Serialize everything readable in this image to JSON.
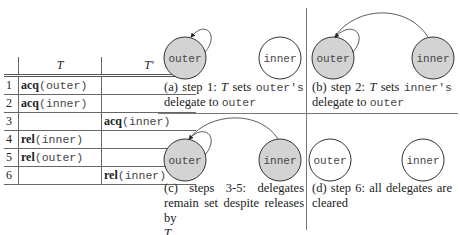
{
  "table": {
    "headers": [
      "",
      "T",
      "T′"
    ],
    "rows": [
      {
        "n": "1",
        "t_op": "acq",
        "t_arg": "(outer)",
        "tp_op": "",
        "tp_arg": ""
      },
      {
        "n": "2",
        "t_op": "acq",
        "t_arg": "(inner)",
        "tp_op": "",
        "tp_arg": ""
      },
      {
        "n": "3",
        "t_op": "",
        "t_arg": "",
        "tp_op": "acq",
        "tp_arg": "(inner)"
      },
      {
        "n": "4",
        "t_op": "rel",
        "t_arg": "(inner)",
        "tp_op": "",
        "tp_arg": ""
      },
      {
        "n": "5",
        "t_op": "rel",
        "t_arg": "(outer)",
        "tp_op": "",
        "tp_arg": ""
      },
      {
        "n": "6",
        "t_op": "",
        "t_arg": "",
        "tp_op": "rel",
        "tp_arg": "(inner)"
      }
    ]
  },
  "panels": {
    "a": {
      "outer_label": "outer",
      "inner_label": "inner",
      "outer_filled": true,
      "inner_filled": false,
      "caption": {
        "p1": "(a) step 1: ",
        "T": "T",
        "p2": " sets ",
        "m1": "outer's",
        "p3": " delegate to ",
        "m2": "outer"
      }
    },
    "b": {
      "outer_label": "outer",
      "inner_label": "inner",
      "outer_filled": true,
      "inner_filled": true,
      "caption": {
        "p1": "(b) step 2: ",
        "T": "T",
        "p2": " sets ",
        "m1": "inner's",
        "p3": " delegate to ",
        "m2": "outer"
      }
    },
    "c": {
      "outer_label": "outer",
      "inner_label": "inner",
      "outer_filled": true,
      "inner_filled": true,
      "caption": {
        "p1": "(c) steps 3-5: delegates remain set despite releases by ",
        "T": "T"
      }
    },
    "d": {
      "outer_label": "outer",
      "inner_label": "inner",
      "outer_filled": false,
      "inner_filled": false,
      "caption": {
        "p1": "(d) step 6: all delegates are cleared"
      }
    }
  },
  "colors": {
    "fill": "#d3d3d3",
    "stroke": "#333333"
  }
}
